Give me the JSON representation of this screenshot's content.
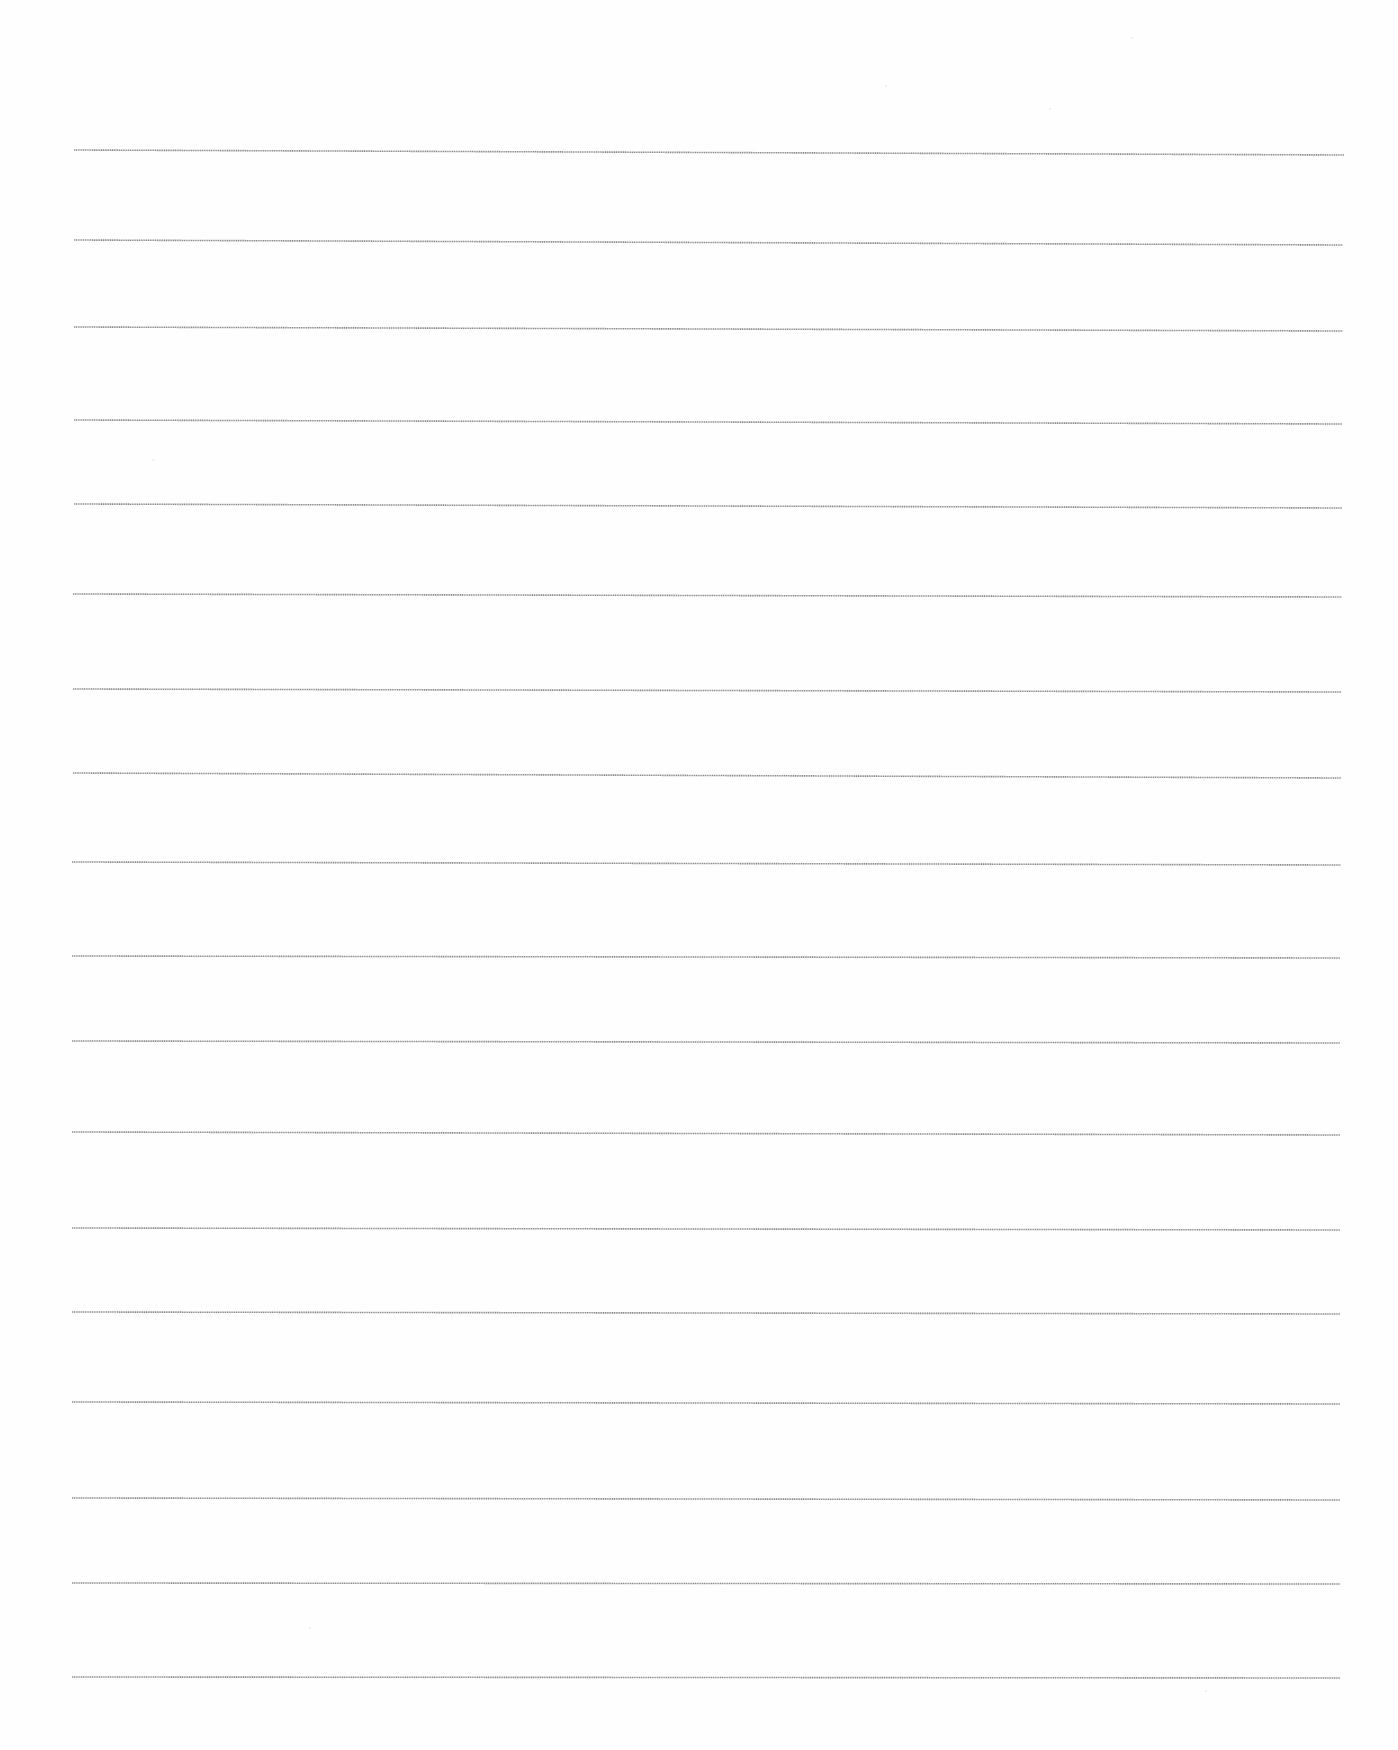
{
  "document": {
    "type": "ruled-paper",
    "background_color": "#fefefe",
    "rule_color": "#8c8c8c",
    "rule_count": 18,
    "rules": [
      {
        "x1": 74,
        "y1": 150,
        "x2": 1344,
        "y2": 155
      },
      {
        "x1": 74,
        "y1": 240,
        "x2": 1343,
        "y2": 245
      },
      {
        "x1": 74,
        "y1": 327,
        "x2": 1343,
        "y2": 331
      },
      {
        "x1": 74,
        "y1": 420,
        "x2": 1342,
        "y2": 424
      },
      {
        "x1": 74,
        "y1": 504,
        "x2": 1342,
        "y2": 508
      },
      {
        "x1": 73,
        "y1": 594,
        "x2": 1342,
        "y2": 597
      },
      {
        "x1": 73,
        "y1": 689,
        "x2": 1341,
        "y2": 692
      },
      {
        "x1": 73,
        "y1": 773,
        "x2": 1341,
        "y2": 778
      },
      {
        "x1": 72,
        "y1": 862,
        "x2": 1341,
        "y2": 865
      },
      {
        "x1": 72,
        "y1": 956,
        "x2": 1340,
        "y2": 958
      },
      {
        "x1": 72,
        "y1": 1041,
        "x2": 1340,
        "y2": 1043
      },
      {
        "x1": 72,
        "y1": 1132,
        "x2": 1340,
        "y2": 1135
      },
      {
        "x1": 72,
        "y1": 1228,
        "x2": 1340,
        "y2": 1230
      },
      {
        "x1": 72,
        "y1": 1312,
        "x2": 1340,
        "y2": 1314
      },
      {
        "x1": 72,
        "y1": 1402,
        "x2": 1340,
        "y2": 1404
      },
      {
        "x1": 72,
        "y1": 1498,
        "x2": 1340,
        "y2": 1500
      },
      {
        "x1": 72,
        "y1": 1583,
        "x2": 1340,
        "y2": 1584
      },
      {
        "x1": 72,
        "y1": 1677,
        "x2": 1340,
        "y2": 1678
      }
    ]
  }
}
